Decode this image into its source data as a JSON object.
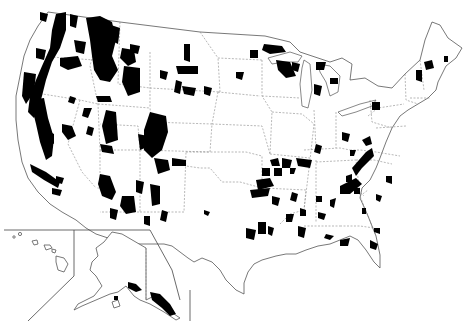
{
  "map": {
    "subject": "Contiguous United States with Alaska and Hawaii insets showing national forest lands",
    "colors": {
      "background": "#ffffff",
      "forest_fill": "#000000",
      "border": "#555555",
      "state_border": "#888888"
    },
    "insets": [
      "Hawaii",
      "Alaska"
    ],
    "regions": [
      {
        "name": "Pacific Northwest"
      },
      {
        "name": "Northern Rockies"
      },
      {
        "name": "Southern Rockies"
      },
      {
        "name": "California Sierra"
      },
      {
        "name": "Great Lakes"
      },
      {
        "name": "Appalachians"
      },
      {
        "name": "Ozarks / Ouachita"
      },
      {
        "name": "Southeast"
      },
      {
        "name": "New England"
      },
      {
        "name": "Southeast Alaska"
      }
    ]
  }
}
